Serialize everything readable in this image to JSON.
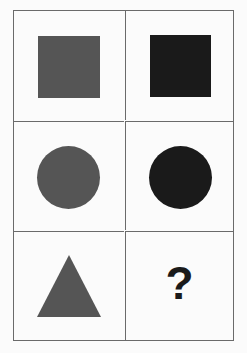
{
  "puzzle": {
    "grid": {
      "rows": 3,
      "columns": 2,
      "border_color": "#6a6a6a",
      "background": "#fbfbfb"
    },
    "colors": {
      "gray": "#555555",
      "black": "#1a1a1a"
    },
    "cells": [
      {
        "row": 0,
        "col": 0,
        "shape": "square",
        "color": "gray"
      },
      {
        "row": 0,
        "col": 1,
        "shape": "square",
        "color": "black"
      },
      {
        "row": 1,
        "col": 0,
        "shape": "circle",
        "color": "gray"
      },
      {
        "row": 1,
        "col": 1,
        "shape": "circle",
        "color": "black"
      },
      {
        "row": 2,
        "col": 0,
        "shape": "triangle",
        "color": "gray"
      },
      {
        "row": 2,
        "col": 1,
        "shape": "unknown",
        "label": "?"
      }
    ]
  }
}
